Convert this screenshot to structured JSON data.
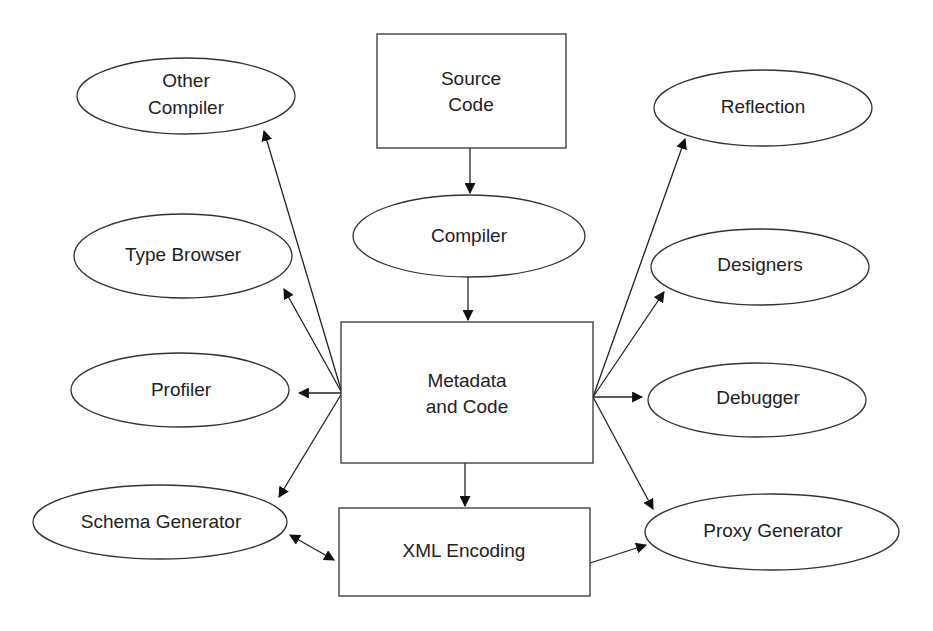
{
  "diagram": {
    "nodes": {
      "source_code": {
        "shape": "rect",
        "lines": [
          "Source",
          "Code"
        ]
      },
      "compiler": {
        "shape": "ellipse",
        "lines": [
          "Compiler"
        ]
      },
      "metadata_and_code": {
        "shape": "rect",
        "lines": [
          "Metadata",
          "and Code"
        ]
      },
      "xml_encoding": {
        "shape": "rect",
        "lines": [
          "XML Encoding"
        ]
      },
      "other_compiler": {
        "shape": "ellipse",
        "lines": [
          "Other",
          "Compiler"
        ]
      },
      "type_browser": {
        "shape": "ellipse",
        "lines": [
          "Type Browser"
        ]
      },
      "profiler": {
        "shape": "ellipse",
        "lines": [
          "Profiler"
        ]
      },
      "schema_generator": {
        "shape": "ellipse",
        "lines": [
          "Schema Generator"
        ]
      },
      "reflection": {
        "shape": "ellipse",
        "lines": [
          "Reflection"
        ]
      },
      "designers": {
        "shape": "ellipse",
        "lines": [
          "Designers"
        ]
      },
      "debugger": {
        "shape": "ellipse",
        "lines": [
          "Debugger"
        ]
      },
      "proxy_generator": {
        "shape": "ellipse",
        "lines": [
          "Proxy Generator"
        ]
      }
    },
    "edges": [
      {
        "from": "source_code",
        "to": "compiler",
        "direction": "forward"
      },
      {
        "from": "compiler",
        "to": "metadata_and_code",
        "direction": "forward"
      },
      {
        "from": "metadata_and_code",
        "to": "xml_encoding",
        "direction": "forward"
      },
      {
        "from": "metadata_and_code",
        "to": "other_compiler",
        "direction": "forward"
      },
      {
        "from": "metadata_and_code",
        "to": "type_browser",
        "direction": "forward"
      },
      {
        "from": "metadata_and_code",
        "to": "profiler",
        "direction": "forward"
      },
      {
        "from": "metadata_and_code",
        "to": "schema_generator",
        "direction": "forward"
      },
      {
        "from": "metadata_and_code",
        "to": "reflection",
        "direction": "forward"
      },
      {
        "from": "metadata_and_code",
        "to": "designers",
        "direction": "forward"
      },
      {
        "from": "metadata_and_code",
        "to": "debugger",
        "direction": "forward"
      },
      {
        "from": "metadata_and_code",
        "to": "proxy_generator",
        "direction": "forward"
      },
      {
        "from": "schema_generator",
        "to": "xml_encoding",
        "direction": "both"
      },
      {
        "from": "xml_encoding",
        "to": "proxy_generator",
        "direction": "forward"
      }
    ]
  }
}
